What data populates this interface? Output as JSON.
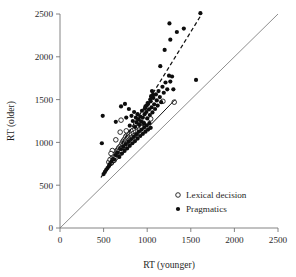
{
  "chart_data": {
    "type": "scatter",
    "title": "",
    "xlabel": "RT (younger)",
    "ylabel": "RT (older)",
    "xlim": [
      0,
      2500
    ],
    "ylim": [
      0,
      2500
    ],
    "xticks": [
      0,
      500,
      1000,
      1500,
      2000,
      2500
    ],
    "yticks": [
      0,
      500,
      1000,
      1500,
      2000,
      2500
    ],
    "xtick_labels": [
      "0",
      "500",
      "1000",
      "1500",
      "2000",
      "2500"
    ],
    "ytick_labels": [
      "0",
      "500",
      "1000",
      "1500",
      "2000",
      "2500"
    ],
    "grid": false,
    "legend_position": "lower right",
    "legend": [
      {
        "label": "Lexical decision",
        "marker": "open-circle"
      },
      {
        "label": "Pragmatics",
        "marker": "filled-circle"
      }
    ],
    "reference_lines": [
      {
        "name": "identity-line",
        "style": "solid-thin-gray",
        "x": [
          0,
          2500
        ],
        "y": [
          0,
          2500
        ]
      },
      {
        "name": "lexical-decision-fit",
        "style": "solid-black",
        "x": [
          560,
          1320
        ],
        "y": [
          700,
          1500
        ]
      },
      {
        "name": "pragmatics-fit",
        "style": "dashed-black",
        "x": [
          470,
          1620
        ],
        "y": [
          590,
          2490
        ]
      }
    ],
    "series": [
      {
        "name": "Lexical decision",
        "marker": "open-circle",
        "points": [
          [
            560,
            770
          ],
          [
            575,
            800
          ],
          [
            590,
            760
          ],
          [
            600,
            820
          ],
          [
            610,
            855
          ],
          [
            620,
            790
          ],
          [
            630,
            870
          ],
          [
            635,
            840
          ],
          [
            645,
            900
          ],
          [
            650,
            860
          ],
          [
            660,
            910
          ],
          [
            665,
            880
          ],
          [
            672,
            935
          ],
          [
            680,
            905
          ],
          [
            688,
            950
          ],
          [
            695,
            925
          ],
          [
            700,
            965
          ],
          [
            705,
            900
          ],
          [
            710,
            990
          ],
          [
            715,
            945
          ],
          [
            720,
            1010
          ],
          [
            725,
            975
          ],
          [
            730,
            1025
          ],
          [
            735,
            960
          ],
          [
            740,
            1000
          ],
          [
            745,
            1045
          ],
          [
            750,
            1020
          ],
          [
            755,
            1070
          ],
          [
            760,
            990
          ],
          [
            765,
            1035
          ],
          [
            770,
            1085
          ],
          [
            775,
            1050
          ],
          [
            780,
            1010
          ],
          [
            785,
            1100
          ],
          [
            790,
            1060
          ],
          [
            795,
            1030
          ],
          [
            800,
            1110
          ],
          [
            805,
            1075
          ],
          [
            810,
            1045
          ],
          [
            815,
            1125
          ],
          [
            820,
            1090
          ],
          [
            828,
            1060
          ],
          [
            835,
            1140
          ],
          [
            842,
            1105
          ],
          [
            850,
            1080
          ],
          [
            858,
            1155
          ],
          [
            865,
            1120
          ],
          [
            875,
            1095
          ],
          [
            885,
            1170
          ],
          [
            895,
            1135
          ],
          [
            905,
            1185
          ],
          [
            915,
            1150
          ],
          [
            925,
            1205
          ],
          [
            940,
            1175
          ],
          [
            955,
            1225
          ],
          [
            700,
            1260
          ],
          [
            1180,
            1480
          ],
          [
            1310,
            1470
          ],
          [
            690,
            1120
          ],
          [
            760,
            1135
          ],
          [
            640,
            1030
          ],
          [
            600,
            905
          ],
          [
            585,
            870
          ],
          [
            870,
            1220
          ],
          [
            1040,
            1275
          ]
        ]
      },
      {
        "name": "Pragmatics",
        "marker": "filled-circle",
        "points": [
          [
            480,
            990
          ],
          [
            490,
            1310
          ],
          [
            640,
            1240
          ],
          [
            700,
            1420
          ],
          [
            745,
            1450
          ],
          [
            760,
            1290
          ],
          [
            790,
            1390
          ],
          [
            800,
            1195
          ],
          [
            820,
            1310
          ],
          [
            835,
            1250
          ],
          [
            850,
            1355
          ],
          [
            860,
            1180
          ],
          [
            870,
            1290
          ],
          [
            880,
            1230
          ],
          [
            890,
            1330
          ],
          [
            900,
            1270
          ],
          [
            910,
            1205
          ],
          [
            920,
            1300
          ],
          [
            930,
            1245
          ],
          [
            940,
            1370
          ],
          [
            950,
            1290
          ],
          [
            960,
            1225
          ],
          [
            970,
            1330
          ],
          [
            980,
            1420
          ],
          [
            990,
            1355
          ],
          [
            1000,
            1280
          ],
          [
            1010,
            1450
          ],
          [
            1020,
            1385
          ],
          [
            1030,
            1320
          ],
          [
            1040,
            1480
          ],
          [
            1050,
            1410
          ],
          [
            1060,
            1350
          ],
          [
            1070,
            1520
          ],
          [
            1080,
            1445
          ],
          [
            1090,
            1390
          ],
          [
            1100,
            1560
          ],
          [
            1110,
            1490
          ],
          [
            1120,
            1430
          ],
          [
            1130,
            1600
          ],
          [
            1145,
            1530
          ],
          [
            1160,
            1470
          ],
          [
            1175,
            1650
          ],
          [
            1190,
            1580
          ],
          [
            1210,
            1700
          ],
          [
            1230,
            1620
          ],
          [
            1250,
            1780
          ],
          [
            1265,
            1710
          ],
          [
            1285,
            1770
          ],
          [
            1300,
            1620
          ],
          [
            1150,
            1890
          ],
          [
            1200,
            2080
          ],
          [
            1265,
            2200
          ],
          [
            1255,
            2390
          ],
          [
            1340,
            2290
          ],
          [
            1420,
            2330
          ],
          [
            1610,
            2510
          ],
          [
            1560,
            1730
          ],
          [
            620,
            800
          ],
          [
            640,
            850
          ],
          [
            660,
            880
          ],
          [
            680,
            830
          ],
          [
            700,
            920
          ],
          [
            710,
            870
          ],
          [
            725,
            950
          ],
          [
            740,
            900
          ],
          [
            755,
            980
          ],
          [
            770,
            930
          ],
          [
            785,
            1010
          ],
          [
            800,
            960
          ],
          [
            815,
            1040
          ],
          [
            830,
            990
          ],
          [
            845,
            1065
          ],
          [
            860,
            1015
          ],
          [
            875,
            1095
          ],
          [
            890,
            1045
          ],
          [
            905,
            1125
          ],
          [
            920,
            1075
          ],
          [
            935,
            1150
          ],
          [
            950,
            1100
          ],
          [
            965,
            1175
          ],
          [
            980,
            1125
          ],
          [
            995,
            1200
          ],
          [
            1010,
            1150
          ],
          [
            1025,
            1225
          ],
          [
            1040,
            1170
          ],
          [
            570,
            745
          ],
          [
            590,
            775
          ],
          [
            605,
            805
          ],
          [
            560,
            720
          ],
          [
            545,
            700
          ],
          [
            530,
            680
          ],
          [
            515,
            655
          ],
          [
            500,
            630
          ],
          [
            1055,
            1600
          ],
          [
            1065,
            1555
          ],
          [
            1045,
            1540
          ],
          [
            1035,
            1500
          ],
          [
            1005,
            1460
          ],
          [
            995,
            1430
          ],
          [
            975,
            1395
          ]
        ]
      }
    ]
  },
  "axes": {
    "x_title": "RT (younger)",
    "y_title": "RT (older)"
  }
}
